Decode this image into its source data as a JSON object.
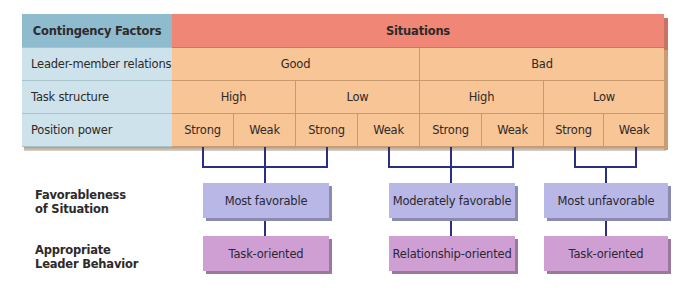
{
  "table": {
    "header": {
      "factors_label": "Contingency Factors",
      "situations_label": "Situations"
    },
    "rows": [
      {
        "label": "Leader-member relations",
        "cells": [
          "Good",
          "Bad"
        ]
      },
      {
        "label": "Task structure",
        "cells": [
          "High",
          "Low",
          "High",
          "Low"
        ]
      },
      {
        "label": "Position power",
        "cells": [
          "Strong",
          "Weak",
          "Strong",
          "Weak",
          "Strong",
          "Weak",
          "Strong",
          "Weak"
        ]
      }
    ]
  },
  "outcomes": {
    "favorableness_label": "Favorableness\nof Situation",
    "favorableness_label_lines": [
      "Favorableness",
      "of Situation"
    ],
    "behavior_label_lines": [
      "Appropriate",
      "Leader Behavior"
    ],
    "groups": [
      {
        "favorableness": "Most favorable",
        "behavior": "Task-oriented",
        "situations": [
          1,
          2,
          3
        ]
      },
      {
        "favorableness": "Moderately favorable",
        "behavior": "Relationship-oriented",
        "situations": [
          4,
          5,
          6
        ]
      },
      {
        "favorableness": "Most unfavorable",
        "behavior": "Task-oriented",
        "situations": [
          7,
          8
        ]
      }
    ]
  },
  "colors": {
    "factors_header": "#8fbbcf",
    "factors_cells": "#cde2ea",
    "situations_header": "#ef8676",
    "situations_cells": "#f7c596",
    "favorableness_box": "#b8b7e6",
    "behavior_box": "#cf9fd3",
    "connector": "#2a2f86"
  }
}
